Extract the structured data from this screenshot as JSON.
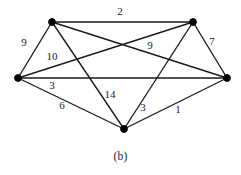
{
  "figure": {
    "caption": "(b)",
    "type": "weighted-undirected-graph",
    "canvas": {
      "width": 241,
      "height": 175
    },
    "style": {
      "background": "#ffffff",
      "edge_color": "#1a1a1a",
      "vertex_color": "#000000",
      "label_color": "#1c1c1c"
    }
  },
  "chart_data": {
    "type": "diagram",
    "title": "(b)",
    "xlabel": "",
    "ylabel": "",
    "nodes": [
      {
        "id": "top-left",
        "label": "",
        "x": 52,
        "y": 22,
        "r": 3.4
      },
      {
        "id": "top-right",
        "label": "",
        "x": 193,
        "y": 22,
        "r": 3.4
      },
      {
        "id": "left",
        "label": "",
        "x": 18,
        "y": 78,
        "r": 3.4
      },
      {
        "id": "right",
        "label": "",
        "x": 227,
        "y": 78,
        "r": 3.4
      },
      {
        "id": "bottom",
        "label": "",
        "x": 124,
        "y": 129,
        "r": 3.4
      }
    ],
    "edges": [
      {
        "from": "top-left",
        "to": "top-right",
        "weight": "2",
        "lx": 120,
        "ly": 12
      },
      {
        "from": "left",
        "to": "top-left",
        "weight": "9",
        "lx": 24,
        "ly": 43
      },
      {
        "from": "left",
        "to": "top-right",
        "weight": "9",
        "lx": 150,
        "ly": 46
      },
      {
        "from": "top-right",
        "to": "right",
        "weight": "7",
        "lx": 212,
        "ly": 42
      },
      {
        "from": "top-left",
        "to": "right",
        "weight": "10",
        "lx": 52,
        "ly": 57
      },
      {
        "from": "left",
        "to": "right",
        "weight": "3",
        "lx": 52,
        "ly": 86
      },
      {
        "from": "left",
        "to": "bottom",
        "weight": "6",
        "lx": 62,
        "ly": 106
      },
      {
        "from": "top-left",
        "to": "bottom",
        "weight": "14",
        "lx": 110,
        "ly": 95
      },
      {
        "from": "top-right",
        "to": "bottom",
        "weight": "3",
        "lx": 143,
        "ly": 108
      },
      {
        "from": "right",
        "to": "bottom",
        "weight": "1",
        "lx": 178,
        "ly": 110
      }
    ]
  }
}
